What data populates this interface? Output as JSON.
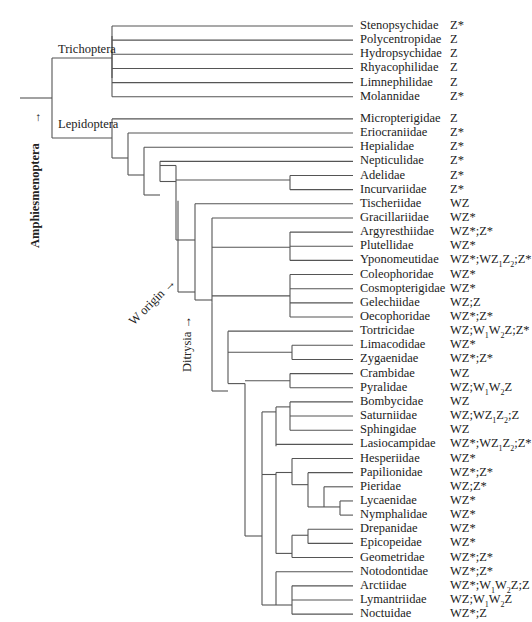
{
  "clades": {
    "trichoptera": "Trichoptera",
    "lepidoptera": "Lepidoptera",
    "amphiesmenoptera": "Amphiesmenoptera",
    "w_origin": "W origin",
    "ditrysia": "Ditrysia"
  },
  "taxa": [
    {
      "name": "Stenopsychidae",
      "sex_chromosomes": "Z*"
    },
    {
      "name": "Polycentropidae",
      "sex_chromosomes": "Z"
    },
    {
      "name": "Hydropsychidae",
      "sex_chromosomes": "Z"
    },
    {
      "name": "Rhyacophilidae",
      "sex_chromosomes": "Z"
    },
    {
      "name": "Limnephilidae",
      "sex_chromosomes": "Z"
    },
    {
      "name": "Molannidae",
      "sex_chromosomes": "Z*"
    },
    {
      "name": "Micropterigidae",
      "sex_chromosomes": "Z"
    },
    {
      "name": "Eriocraniidae",
      "sex_chromosomes": "Z*"
    },
    {
      "name": "Hepialidae",
      "sex_chromosomes": "Z*"
    },
    {
      "name": "Nepticulidae",
      "sex_chromosomes": "Z*"
    },
    {
      "name": "Adelidae",
      "sex_chromosomes": "Z*"
    },
    {
      "name": "Incurvariidae",
      "sex_chromosomes": "Z*"
    },
    {
      "name": "Tischeriidae",
      "sex_chromosomes": "WZ"
    },
    {
      "name": "Gracillariidae",
      "sex_chromosomes": "WZ*"
    },
    {
      "name": "Argyresthiidae",
      "sex_chromosomes": "WZ*;Z*"
    },
    {
      "name": "Plutellidae",
      "sex_chromosomes": "WZ*"
    },
    {
      "name": "Yponomeutidae",
      "sex_chromosomes": "WZ*;WZ1Z2;Z*"
    },
    {
      "name": "Coleophoridae",
      "sex_chromosomes": "WZ*"
    },
    {
      "name": "Cosmopterigidae",
      "sex_chromosomes": "WZ*"
    },
    {
      "name": "Gelechiidae",
      "sex_chromosomes": "WZ;Z"
    },
    {
      "name": "Oecophoridae",
      "sex_chromosomes": "WZ*;Z*"
    },
    {
      "name": "Tortricidae",
      "sex_chromosomes": "WZ;W1W2Z;Z*"
    },
    {
      "name": "Limacodidae",
      "sex_chromosomes": "WZ*"
    },
    {
      "name": "Zygaenidae",
      "sex_chromosomes": "WZ*;Z*"
    },
    {
      "name": "Crambidae",
      "sex_chromosomes": "WZ"
    },
    {
      "name": "Pyralidae",
      "sex_chromosomes": "WZ;W1W2Z"
    },
    {
      "name": "Bombycidae",
      "sex_chromosomes": "WZ"
    },
    {
      "name": "Saturniidae",
      "sex_chromosomes": "WZ;WZ1Z2;Z"
    },
    {
      "name": "Sphingidae",
      "sex_chromosomes": "WZ"
    },
    {
      "name": "Lasiocampidae",
      "sex_chromosomes": "WZ*;WZ1Z2;Z*"
    },
    {
      "name": "Hesperiidae",
      "sex_chromosomes": "WZ*"
    },
    {
      "name": "Papilionidae",
      "sex_chromosomes": "WZ*;Z*"
    },
    {
      "name": "Pieridae",
      "sex_chromosomes": "WZ;Z*"
    },
    {
      "name": "Lycaenidae",
      "sex_chromosomes": "WZ*"
    },
    {
      "name": "Nymphalidae",
      "sex_chromosomes": "WZ*"
    },
    {
      "name": "Drepanidae",
      "sex_chromosomes": "WZ*"
    },
    {
      "name": "Epicopeidae",
      "sex_chromosomes": "WZ*"
    },
    {
      "name": "Geometridae",
      "sex_chromosomes": "WZ*;Z*"
    },
    {
      "name": "Notodontidae",
      "sex_chromosomes": "WZ*;Z*"
    },
    {
      "name": "Arctiidae",
      "sex_chromosomes": "WZ*;W1W2Z;Z"
    },
    {
      "name": "Lymantriidae",
      "sex_chromosomes": "WZ;W1W2Z"
    },
    {
      "name": "Noctuidae",
      "sex_chromosomes": "WZ*;Z"
    }
  ]
}
